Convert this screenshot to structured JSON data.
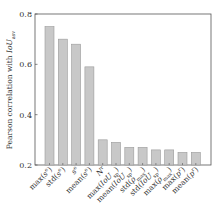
{
  "chart_data": {
    "type": "bar",
    "title": "",
    "xlabel": "",
    "ylabel": "Pearson correlation with IoU_asv",
    "ylim": [
      0.2,
      0.8
    ],
    "yticks": [
      0.2,
      0.4,
      0.6,
      0.8
    ],
    "ytick_labels": [
      "0.2",
      "0.4",
      "0.6",
      "0.8"
    ],
    "grid": false,
    "legend": null,
    "bar_color": "#c8c8c8",
    "bar_edge_color": "#9a9a9a",
    "categories": [
      "max(s^e)",
      "std(s^e)",
      "s^e",
      "mean(s^e)",
      "N^r",
      "max(IoU_sp)",
      "mean(IoU_sp)",
      "std(ρ_max)",
      "std(IoU_sp)",
      "max(ρ_max)",
      "max(p^r)",
      "mean(p^r)"
    ],
    "values": [
      0.75,
      0.7,
      0.68,
      0.59,
      0.3,
      0.29,
      0.27,
      0.27,
      0.26,
      0.26,
      0.25,
      0.25
    ]
  },
  "labels_html": [
    "max(<tspan font-style='italic'>s</tspan><tspan baseline-shift='super' font-size='5'>e</tspan>)",
    "std(<tspan font-style='italic'>s</tspan><tspan baseline-shift='super' font-size='5'>e</tspan>)",
    "<tspan font-style='italic'>s</tspan><tspan baseline-shift='super' font-size='5'>e</tspan>",
    "mean(<tspan font-style='italic'>s</tspan><tspan baseline-shift='super' font-size='5'>e</tspan>)",
    "<tspan font-style='italic'>N</tspan><tspan baseline-shift='super' font-size='5'>r</tspan>",
    "max(<tspan font-style='italic'>IoU</tspan><tspan baseline-shift='sub' font-size='5'>sp</tspan>)",
    "mean(<tspan font-style='italic'>IoU</tspan><tspan baseline-shift='sub' font-size='5'>sp</tspan>)",
    "std(<tspan font-style='italic'>ρ</tspan><tspan baseline-shift='sub' font-size='5'>max</tspan>)",
    "std(<tspan font-style='italic'>IoU</tspan><tspan baseline-shift='sub' font-size='5'>sp</tspan>)",
    "max(<tspan font-style='italic'>ρ</tspan><tspan baseline-shift='sub' font-size='5'>max</tspan>)",
    "max(<tspan font-style='italic'>p</tspan><tspan baseline-shift='super' font-size='5'>r</tspan>)",
    "mean(<tspan font-style='italic'>p</tspan><tspan baseline-shift='super' font-size='5'>r</tspan>)"
  ]
}
